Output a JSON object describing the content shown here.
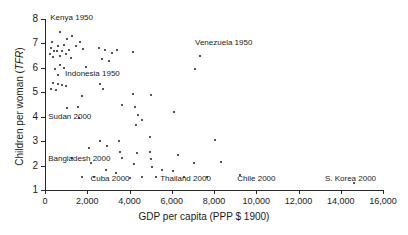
{
  "chart_data": {
    "type": "scatter",
    "title": "",
    "xlabel": "GDP per capita (PPP $ 1900)",
    "ylabel": "Children per woman (TFR)",
    "ylabel_plain": "Children per woman (",
    "ylabel_italic": "TFR",
    "ylabel_tail": ")",
    "xlim": [
      0,
      16000
    ],
    "ylim": [
      1,
      8
    ],
    "grid": false,
    "legend": null,
    "xticks": [
      0,
      2000,
      4000,
      6000,
      8000,
      10000,
      12000,
      14000,
      16000
    ],
    "xtick_labels": [
      "0",
      "2,000",
      "4,000",
      "6,000",
      "8,000",
      "10,000",
      "12,000",
      "14,000",
      "16,000"
    ],
    "yticks": [
      1,
      2,
      3,
      4,
      5,
      6,
      7,
      8
    ],
    "ytick_labels": [
      "1",
      "2",
      "3",
      "4",
      "5",
      "6",
      "7",
      "8"
    ],
    "annotations": [
      {
        "text": "Kenya 1950",
        "x": 250,
        "y": 8.05
      },
      {
        "text": "Venezuela 1950",
        "x": 7100,
        "y": 7.0
      },
      {
        "text": "Indonesia 1950",
        "x": 950,
        "y": 5.75
      },
      {
        "text": "Sudan 2000",
        "x": 150,
        "y": 4.0
      },
      {
        "text": "Bangladesh 2000",
        "x": 150,
        "y": 2.25
      },
      {
        "text": "Cuba 2000",
        "x": 2150,
        "y": 1.45
      },
      {
        "text": "Thailand 2000",
        "x": 5450,
        "y": 1.45
      },
      {
        "text": "Chile 2000",
        "x": 9100,
        "y": 1.45
      },
      {
        "text": "S. Korea 2000",
        "x": 13250,
        "y": 1.45
      }
    ],
    "points": [
      {
        "x": 700,
        "y": 7.45
      },
      {
        "x": 350,
        "y": 7.05
      },
      {
        "x": 1050,
        "y": 7.2
      },
      {
        "x": 1300,
        "y": 7.3
      },
      {
        "x": 1650,
        "y": 7.05
      },
      {
        "x": 900,
        "y": 6.95
      },
      {
        "x": 620,
        "y": 6.9
      },
      {
        "x": 300,
        "y": 6.8
      },
      {
        "x": 430,
        "y": 6.7
      },
      {
        "x": 560,
        "y": 6.68
      },
      {
        "x": 800,
        "y": 6.7
      },
      {
        "x": 1150,
        "y": 6.72
      },
      {
        "x": 1480,
        "y": 6.9
      },
      {
        "x": 1800,
        "y": 6.78
      },
      {
        "x": 250,
        "y": 6.55
      },
      {
        "x": 380,
        "y": 6.45
      },
      {
        "x": 700,
        "y": 6.5
      },
      {
        "x": 980,
        "y": 6.55
      },
      {
        "x": 1250,
        "y": 6.4
      },
      {
        "x": 2550,
        "y": 6.8
      },
      {
        "x": 2850,
        "y": 6.75
      },
      {
        "x": 3150,
        "y": 6.6
      },
      {
        "x": 3400,
        "y": 6.72
      },
      {
        "x": 2700,
        "y": 6.35
      },
      {
        "x": 3050,
        "y": 6.3
      },
      {
        "x": 4150,
        "y": 6.65
      },
      {
        "x": 7350,
        "y": 6.5
      },
      {
        "x": 700,
        "y": 6.1
      },
      {
        "x": 900,
        "y": 6.0
      },
      {
        "x": 450,
        "y": 5.95
      },
      {
        "x": 1950,
        "y": 6.05
      },
      {
        "x": 600,
        "y": 5.7
      },
      {
        "x": 380,
        "y": 5.4
      },
      {
        "x": 620,
        "y": 5.35
      },
      {
        "x": 800,
        "y": 5.3
      },
      {
        "x": 1000,
        "y": 5.25
      },
      {
        "x": 300,
        "y": 5.15
      },
      {
        "x": 520,
        "y": 5.1
      },
      {
        "x": 2600,
        "y": 5.35
      },
      {
        "x": 2750,
        "y": 5.15
      },
      {
        "x": 1750,
        "y": 4.85
      },
      {
        "x": 4150,
        "y": 4.95
      },
      {
        "x": 5000,
        "y": 4.9
      },
      {
        "x": 7100,
        "y": 5.95
      },
      {
        "x": 1050,
        "y": 4.35
      },
      {
        "x": 1550,
        "y": 4.4
      },
      {
        "x": 3650,
        "y": 4.5
      },
      {
        "x": 4250,
        "y": 4.4
      },
      {
        "x": 4400,
        "y": 4.05
      },
      {
        "x": 4300,
        "y": 3.65
      },
      {
        "x": 4600,
        "y": 3.85
      },
      {
        "x": 1600,
        "y": 3.95
      },
      {
        "x": 6100,
        "y": 4.2
      },
      {
        "x": 2600,
        "y": 3.0
      },
      {
        "x": 2100,
        "y": 2.7
      },
      {
        "x": 2950,
        "y": 2.8
      },
      {
        "x": 3500,
        "y": 3.0
      },
      {
        "x": 4950,
        "y": 3.15
      },
      {
        "x": 8050,
        "y": 3.05
      },
      {
        "x": 3550,
        "y": 2.55
      },
      {
        "x": 4350,
        "y": 2.5
      },
      {
        "x": 1300,
        "y": 2.3
      },
      {
        "x": 3650,
        "y": 2.3
      },
      {
        "x": 4950,
        "y": 2.55
      },
      {
        "x": 6300,
        "y": 2.45
      },
      {
        "x": 8350,
        "y": 2.15
      },
      {
        "x": 2200,
        "y": 2.1
      },
      {
        "x": 4200,
        "y": 2.05
      },
      {
        "x": 5000,
        "y": 2.25
      },
      {
        "x": 7050,
        "y": 2.1
      },
      {
        "x": 2900,
        "y": 1.8
      },
      {
        "x": 3350,
        "y": 1.7
      },
      {
        "x": 5050,
        "y": 1.95
      },
      {
        "x": 5550,
        "y": 1.8
      },
      {
        "x": 6050,
        "y": 1.78
      },
      {
        "x": 1750,
        "y": 1.55
      },
      {
        "x": 2300,
        "y": 1.52
      },
      {
        "x": 4000,
        "y": 1.5
      },
      {
        "x": 4600,
        "y": 1.55
      },
      {
        "x": 5250,
        "y": 1.52
      },
      {
        "x": 6600,
        "y": 1.55
      },
      {
        "x": 7650,
        "y": 1.55
      },
      {
        "x": 9250,
        "y": 1.62
      },
      {
        "x": 14650,
        "y": 1.28
      }
    ]
  }
}
